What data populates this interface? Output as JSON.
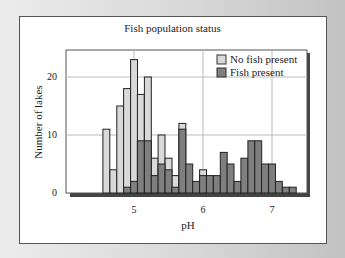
{
  "chart_data": {
    "type": "bar",
    "subtype": "overlaid histogram",
    "title": "Fish population status",
    "xlabel": "pH",
    "ylabel": "Number of lakes",
    "xlim": [
      4.3,
      7.5
    ],
    "ylim": [
      0,
      25
    ],
    "xticks": [
      5,
      6,
      7
    ],
    "yticks": [
      0,
      10,
      20
    ],
    "grid": true,
    "legend_position": "upper right",
    "bin_width": 0.1,
    "bin_starts": [
      4.55,
      4.65,
      4.75,
      4.85,
      4.95,
      5.05,
      5.15,
      5.25,
      5.35,
      5.45,
      5.55,
      5.65,
      5.75,
      5.85,
      5.95,
      6.05,
      6.15,
      6.25,
      6.35,
      6.45,
      6.55,
      6.65,
      6.75,
      6.85,
      6.95,
      7.05,
      7.15,
      7.25,
      7.35
    ],
    "series": [
      {
        "name": "No fish present",
        "color": "#d9d9d9",
        "values": [
          11,
          4,
          15,
          18,
          23,
          17,
          20,
          6,
          10,
          6,
          3,
          12,
          0,
          0,
          4,
          0,
          0,
          0,
          0,
          0,
          0,
          0,
          0,
          0,
          0,
          0,
          0,
          0,
          0
        ]
      },
      {
        "name": "Fish present",
        "color": "#7f7f7f",
        "values": [
          0,
          0,
          0,
          1,
          2,
          9,
          9,
          3,
          5,
          4,
          1,
          11,
          5,
          2,
          3,
          3,
          3,
          7,
          5,
          2,
          6,
          9,
          9,
          5,
          5,
          2,
          1,
          1,
          0
        ]
      }
    ]
  },
  "labels": {
    "title": "Fish population status",
    "xlabel": "pH",
    "ylabel": "Number of lakes",
    "legend_nofish": "No fish present",
    "legend_fish": "Fish present",
    "y0": "0",
    "y10": "10",
    "y20": "20",
    "x5": "5",
    "x6": "6",
    "x7": "7"
  }
}
